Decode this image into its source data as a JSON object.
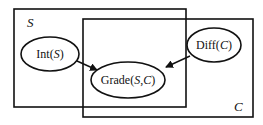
{
  "diagram": {
    "type": "plate-model",
    "plates": [
      {
        "id": "S",
        "label": "S"
      },
      {
        "id": "C",
        "label": "C"
      }
    ],
    "nodes": [
      {
        "id": "int",
        "label_prefix": "Int(",
        "label_var": "S",
        "label_suffix": ")"
      },
      {
        "id": "diff",
        "label_prefix": "Diff(",
        "label_var": "C",
        "label_suffix": ")"
      },
      {
        "id": "grade",
        "label_prefix": "Grade(",
        "label_var1": "S",
        "label_sep": ",",
        "label_var2": "C",
        "label_suffix": ")"
      }
    ],
    "edges": [
      {
        "from": "int",
        "to": "grade"
      },
      {
        "from": "diff",
        "to": "grade"
      }
    ]
  }
}
